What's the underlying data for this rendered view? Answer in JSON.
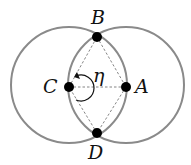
{
  "diagram": {
    "colors": {
      "circle": "#8a8a8a",
      "point": "#000000",
      "dashed": "#777777",
      "text": "#111111"
    },
    "points": {
      "A": {
        "label": "A",
        "x": 126,
        "y": 87
      },
      "B": {
        "label": "B",
        "x": 97,
        "y": 37
      },
      "C": {
        "label": "C",
        "x": 69,
        "y": 87
      },
      "D": {
        "label": "D",
        "x": 97,
        "y": 133
      }
    },
    "angle_label": "η",
    "radius": 57
  }
}
